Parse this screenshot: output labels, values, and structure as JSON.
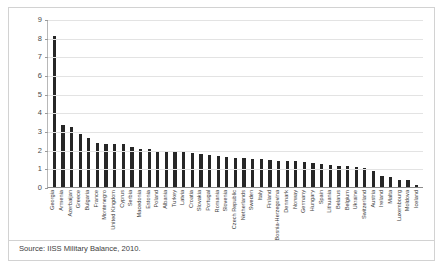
{
  "source": {
    "text": "Source: IISS Military Balance, 2010."
  },
  "chart_data": {
    "type": "bar",
    "title": "",
    "xlabel": "",
    "ylabel": "",
    "ylim": [
      0,
      9
    ],
    "yticks": [
      9,
      8,
      7,
      6,
      5,
      4,
      3,
      2,
      1,
      0
    ],
    "grid": true,
    "legend": "none",
    "bar_color": "#262626",
    "categories": [
      "Georgia",
      "Armenia",
      "Azerbaijan",
      "Greece",
      "Bulgaria",
      "France",
      "Montenegro",
      "United Kingdom",
      "Cyprus",
      "Serbia",
      "Macedonia",
      "Estonia",
      "Poland",
      "Albania",
      "Turkey",
      "Latvia",
      "Croatia",
      "Slovakia",
      "Portugal",
      "Romania",
      "Slovenia",
      "Czech Republic",
      "Netherlands",
      "Sweden",
      "Italy",
      "Finland",
      "Bosnia-Herzegovina",
      "Denmark",
      "Norway",
      "Germany",
      "Hungary",
      "Spain",
      "Lithuania",
      "Belarus",
      "Belgium",
      "Ukraine",
      "Switzerland",
      "Austria",
      "Ireland",
      "Malta",
      "Luxembourg",
      "Moldova",
      "Iceland"
    ],
    "values": [
      8.1,
      3.3,
      3.2,
      2.85,
      2.6,
      2.35,
      2.32,
      2.3,
      2.28,
      2.15,
      2.05,
      2.02,
      1.95,
      1.9,
      1.88,
      1.85,
      1.8,
      1.75,
      1.7,
      1.65,
      1.6,
      1.58,
      1.55,
      1.5,
      1.48,
      1.45,
      1.42,
      1.4,
      1.38,
      1.35,
      1.3,
      1.25,
      1.2,
      1.15,
      1.1,
      1.05,
      1.0,
      0.85,
      0.6,
      0.55,
      0.4,
      0.35,
      0.1
    ]
  }
}
